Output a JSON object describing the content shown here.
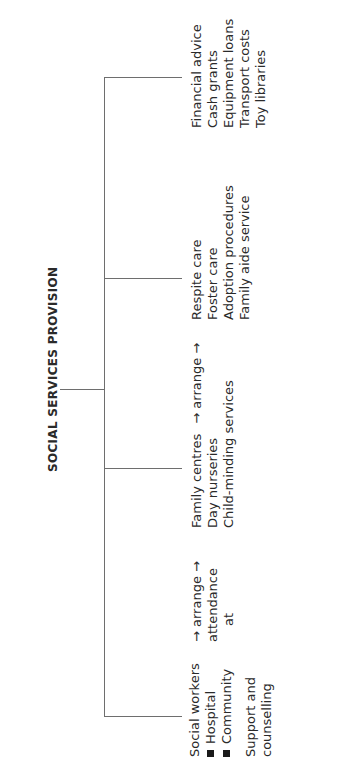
{
  "diagram": {
    "title": "SOCIAL SERVICES PROVISION",
    "line_color": "#6e6e6e",
    "branches": [
      {
        "id": "social-workers",
        "lines": [
          "Social workers"
        ],
        "bullets": [
          "Hospital",
          "Community"
        ],
        "extra_lines": [
          "Support and",
          "counselling"
        ]
      },
      {
        "id": "arrange-attendance",
        "lines": [
          "→ arrange →",
          "attendance",
          "at"
        ]
      },
      {
        "id": "family-centres",
        "lines": [
          "Family centres",
          "Day nurseries",
          "Child-minding services"
        ],
        "arrow_text": "→  arrange  →"
      },
      {
        "id": "respite-care",
        "lines": [
          "Respite care",
          "Foster care",
          "Adoption procedures",
          "Family aide service"
        ]
      },
      {
        "id": "financial",
        "lines": [
          "Financial advice",
          "Cash grants",
          "Equipment loans",
          "Transport costs",
          "Toy libraries"
        ]
      }
    ]
  }
}
